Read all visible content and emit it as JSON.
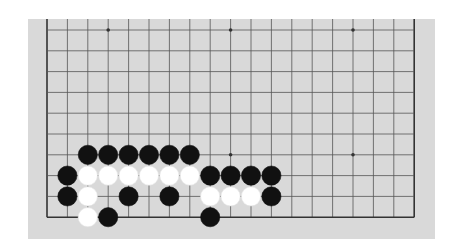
{
  "board": {
    "size": 19,
    "visible_columns": 19,
    "visible_rows": 10,
    "first_visible_row": 9,
    "colors": {
      "board": "#d9d9d9",
      "grid": "#555555",
      "edge": "#333333",
      "black_stone": "#111111",
      "white_stone": "#ffffff"
    },
    "star_points": [
      {
        "col": 3,
        "row": 0
      },
      {
        "col": 9,
        "row": 0
      },
      {
        "col": 15,
        "row": 0
      },
      {
        "col": 3,
        "row": 6
      },
      {
        "col": 9,
        "row": 6
      },
      {
        "col": 15,
        "row": 6
      }
    ],
    "stones": [
      {
        "color": "black",
        "col": 2,
        "row": 6
      },
      {
        "color": "black",
        "col": 3,
        "row": 6
      },
      {
        "color": "black",
        "col": 4,
        "row": 6
      },
      {
        "color": "black",
        "col": 5,
        "row": 6
      },
      {
        "color": "black",
        "col": 6,
        "row": 6
      },
      {
        "color": "black",
        "col": 7,
        "row": 6
      },
      {
        "color": "black",
        "col": 1,
        "row": 7
      },
      {
        "color": "white",
        "col": 2,
        "row": 7
      },
      {
        "color": "white",
        "col": 3,
        "row": 7
      },
      {
        "color": "white",
        "col": 4,
        "row": 7
      },
      {
        "color": "white",
        "col": 5,
        "row": 7
      },
      {
        "color": "white",
        "col": 6,
        "row": 7
      },
      {
        "color": "white",
        "col": 7,
        "row": 7
      },
      {
        "color": "black",
        "col": 8,
        "row": 7
      },
      {
        "color": "black",
        "col": 9,
        "row": 7
      },
      {
        "color": "black",
        "col": 10,
        "row": 7
      },
      {
        "color": "black",
        "col": 11,
        "row": 7
      },
      {
        "color": "black",
        "col": 1,
        "row": 8
      },
      {
        "color": "white",
        "col": 2,
        "row": 8
      },
      {
        "color": "black",
        "col": 4,
        "row": 8
      },
      {
        "color": "black",
        "col": 6,
        "row": 8
      },
      {
        "color": "white",
        "col": 8,
        "row": 8
      },
      {
        "color": "white",
        "col": 9,
        "row": 8
      },
      {
        "color": "white",
        "col": 10,
        "row": 8
      },
      {
        "color": "black",
        "col": 11,
        "row": 8
      },
      {
        "color": "white",
        "col": 2,
        "row": 9
      },
      {
        "color": "black",
        "col": 3,
        "row": 9
      },
      {
        "color": "black",
        "col": 8,
        "row": 9
      }
    ]
  }
}
